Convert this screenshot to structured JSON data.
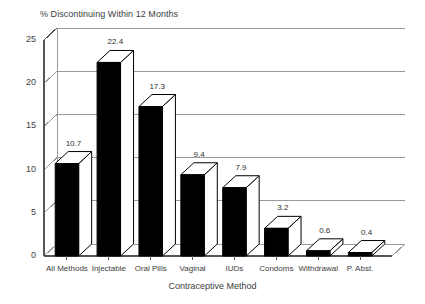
{
  "chart_data": {
    "type": "bar",
    "title": "% Discontinuing Within 12 Months",
    "xlabel": "Contraceptive Method",
    "ylabel": "",
    "categories": [
      "All Methods",
      "Injectable",
      "Oral Pills",
      "Vaginal",
      "IUDs",
      "Condoms",
      "Withdrawal",
      "P. Abst."
    ],
    "values": [
      10.7,
      22.4,
      17.3,
      9.4,
      7.9,
      3.2,
      0.6,
      0.4
    ],
    "value_labels": [
      "10.7",
      "22.4",
      "17.3",
      "9.4",
      "7.9",
      "3.2",
      "0.6",
      "0.4"
    ],
    "ylim": [
      0,
      25
    ],
    "yticks": [
      0,
      5,
      10,
      15,
      20,
      25
    ],
    "ytick_labels": [
      "0",
      "5",
      "10",
      "15",
      "20",
      "25"
    ],
    "grid": true,
    "grid_axis": "y",
    "legend": false,
    "style": "3d-bar",
    "bar_color": "#000000",
    "bar_face_color": "#ffffff",
    "grid_color": "#9a9a9a",
    "axis_color": "#555555",
    "background": "#ffffff"
  }
}
